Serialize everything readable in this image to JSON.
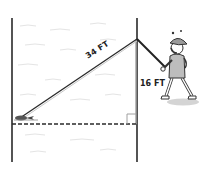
{
  "diagram": {
    "type": "right-triangle-word-problem",
    "labels": {
      "hypotenuse": "34 FT",
      "vertical_leg": "16 FT"
    },
    "elements": {
      "left_post": "vertical boundary line",
      "right_post": "vertical boundary line",
      "baseline": "dashed horizontal line",
      "right_angle_marker": "square corner mark",
      "fish": "fish on the line at bottom-left",
      "angler": "cartoon person holding fishing rod"
    },
    "colors": {
      "line": "#2a2a2a",
      "leg": "#9a9a9a",
      "water": "#e6e6e6",
      "shadow": "#d0d0d0"
    }
  }
}
